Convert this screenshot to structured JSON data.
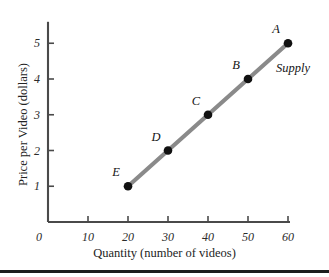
{
  "chart_data": {
    "type": "line",
    "title": "",
    "subtitle": "",
    "xlabel": "Quantity (number of videos)",
    "ylabel": "Price per Video (dollars)",
    "xlim": [
      0,
      60
    ],
    "ylim": [
      0,
      5.6
    ],
    "xticks": [
      "0",
      "10",
      "20",
      "30",
      "40",
      "50",
      "60"
    ],
    "xtick_values": [
      0,
      10,
      20,
      30,
      40,
      50,
      60
    ],
    "yticks": [
      "1",
      "2",
      "3",
      "4",
      "5"
    ],
    "ytick_values": [
      1,
      2,
      3,
      4,
      5
    ],
    "origin_label": "0",
    "grid": false,
    "legend_position": "inline-right",
    "series": [
      {
        "name": "Supply",
        "label": "Supply",
        "color": "#8a8a8a",
        "marker_color": "#111111",
        "x": [
          20,
          30,
          40,
          50,
          60
        ],
        "y": [
          1,
          2,
          3,
          4,
          5
        ],
        "point_labels": [
          "E",
          "D",
          "C",
          "B",
          "A"
        ]
      }
    ],
    "points": [
      {
        "label": "E",
        "x": 20,
        "y": 1
      },
      {
        "label": "D",
        "x": 30,
        "y": 2
      },
      {
        "label": "C",
        "x": 40,
        "y": 3
      },
      {
        "label": "B",
        "x": 50,
        "y": 4
      },
      {
        "label": "A",
        "x": 60,
        "y": 5
      }
    ],
    "annotations": [
      {
        "text": "Supply",
        "x": 57,
        "y": 4.3
      }
    ]
  },
  "figure": {
    "axis_color": "#4a4a4a",
    "line_color": "#8a8a8a",
    "marker_color": "#111111",
    "background": "#ffffff",
    "rule_color": "#1d1d1d"
  }
}
